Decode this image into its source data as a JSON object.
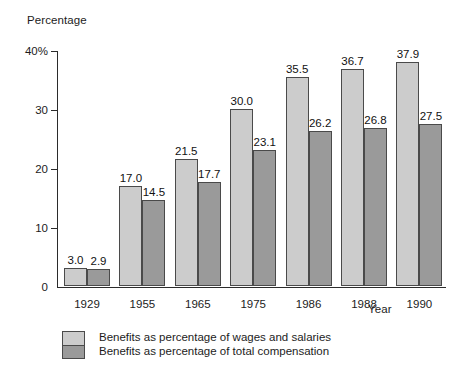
{
  "chart_data": {
    "type": "bar",
    "title": "",
    "ylabel": "Percentage",
    "xlabel": "Year",
    "categories": [
      "1929",
      "1955",
      "1965",
      "1975",
      "1986",
      "1988",
      "1990"
    ],
    "ylim": [
      0,
      40
    ],
    "yticks": [
      0,
      10,
      20,
      30,
      40
    ],
    "ytick_labels": [
      "0",
      "10",
      "20",
      "30",
      "40%"
    ],
    "grid": false,
    "legend_position": "bottom-left",
    "series": [
      {
        "name": "Benefits as percentage of wages and salaries",
        "color": "#cccccc",
        "values": [
          3.0,
          17.0,
          21.5,
          30.0,
          35.5,
          36.7,
          37.9
        ],
        "labels": [
          "3.0",
          "17.0",
          "21.5",
          "30.0",
          "35.5",
          "36.7",
          "37.9"
        ]
      },
      {
        "name": "Benefits as percentage of total compensation",
        "color": "#9a9a9a",
        "values": [
          2.9,
          14.5,
          17.7,
          23.1,
          26.2,
          26.8,
          27.5
        ],
        "labels": [
          "2.9",
          "14.5",
          "17.7",
          "23.1",
          "26.2",
          "26.8",
          "27.5"
        ]
      }
    ]
  },
  "legend": {
    "items": [
      {
        "label": "Benefits as percentage of wages and salaries",
        "swatch": "light"
      },
      {
        "label": "Benefits as percentage of total compensation",
        "swatch": "dark"
      }
    ]
  },
  "axes": {
    "y_title": "Percentage",
    "x_title": "Year"
  }
}
